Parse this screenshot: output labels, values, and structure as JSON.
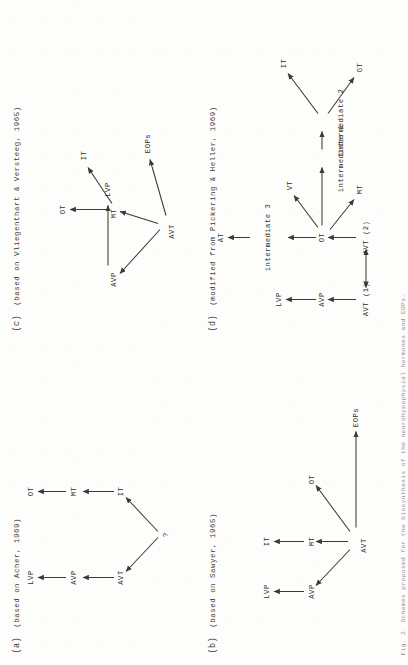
{
  "document": {
    "kind": "scanned-figure",
    "orientation": "rotated-90-ccw",
    "ink_color": "#3a3a38",
    "paper_color": "#fdfdfc"
  },
  "panels": [
    {
      "id": "a",
      "label": "(a)",
      "caption": "(based on Acher, 1969)",
      "nodes": [
        {
          "key": "q",
          "text": "?"
        },
        {
          "key": "avt",
          "text": "AVT"
        },
        {
          "key": "avp",
          "text": "AVP"
        },
        {
          "key": "lvp",
          "text": "LVP"
        },
        {
          "key": "it",
          "text": "IT"
        },
        {
          "key": "mt",
          "text": "MT"
        },
        {
          "key": "ot",
          "text": "OT"
        }
      ],
      "edges": [
        {
          "from": "q",
          "to": "avt",
          "type": "single"
        },
        {
          "from": "q",
          "to": "it",
          "type": "single"
        },
        {
          "from": "avt",
          "to": "avp",
          "type": "single"
        },
        {
          "from": "avp",
          "to": "lvp",
          "type": "single"
        },
        {
          "from": "it",
          "to": "mt",
          "type": "single"
        },
        {
          "from": "mt",
          "to": "ot",
          "type": "single"
        }
      ]
    },
    {
      "id": "b",
      "label": "(b)",
      "caption": "(based on Sawyer, 1965)",
      "nodes": [
        {
          "key": "avt",
          "text": "AVT"
        },
        {
          "key": "avp",
          "text": "AVP"
        },
        {
          "key": "lvp",
          "text": "LVP"
        },
        {
          "key": "mt",
          "text": "MT"
        },
        {
          "key": "it",
          "text": "IT"
        },
        {
          "key": "ot",
          "text": "OT"
        },
        {
          "key": "eops",
          "text": "EOPs"
        }
      ],
      "edges": [
        {
          "from": "avt",
          "to": "avp",
          "type": "single"
        },
        {
          "from": "avp",
          "to": "lvp",
          "type": "single"
        },
        {
          "from": "avt",
          "to": "mt",
          "type": "single"
        },
        {
          "from": "mt",
          "to": "it",
          "type": "single"
        },
        {
          "from": "avt",
          "to": "ot",
          "type": "single"
        },
        {
          "from": "avt",
          "to": "eops",
          "type": "single"
        }
      ]
    },
    {
      "id": "c",
      "label": "(c)",
      "caption": "(based on Vliegenthart & Versteeg, 1965)",
      "nodes": [
        {
          "key": "avt",
          "text": "AVT"
        },
        {
          "key": "avp",
          "text": "AVP"
        },
        {
          "key": "lvp",
          "text": "LVP"
        },
        {
          "key": "mt",
          "text": "MT"
        },
        {
          "key": "ot",
          "text": "OT"
        },
        {
          "key": "it",
          "text": "IT"
        },
        {
          "key": "eops",
          "text": "EOPs"
        }
      ],
      "edges": [
        {
          "from": "avt",
          "to": "avp",
          "type": "single"
        },
        {
          "from": "avp",
          "to": "lvp",
          "type": "single"
        },
        {
          "from": "avt",
          "to": "mt",
          "type": "single"
        },
        {
          "from": "mt",
          "to": "ot",
          "type": "single"
        },
        {
          "from": "mt",
          "to": "it",
          "type": "single"
        },
        {
          "from": "avt",
          "to": "eops",
          "type": "single"
        }
      ]
    },
    {
      "id": "d",
      "label": "(d)",
      "caption": "(modified from Pickering & Heller, 1969)",
      "nodes": [
        {
          "key": "avt1",
          "text": "AVT (1)"
        },
        {
          "key": "avp",
          "text": "AVP"
        },
        {
          "key": "lvp",
          "text": "LVP"
        },
        {
          "key": "avt2",
          "text": "AVT (2)"
        },
        {
          "key": "ot",
          "text": "OT"
        },
        {
          "key": "i3",
          "text": "intermediate 3"
        },
        {
          "key": "at",
          "text": "AT"
        },
        {
          "key": "vt",
          "text": "VT"
        },
        {
          "key": "mt",
          "text": "MT"
        },
        {
          "key": "i1",
          "text": "intermediate 1"
        },
        {
          "key": "i2",
          "text": "intermediate 2"
        },
        {
          "key": "it",
          "text": "IT"
        },
        {
          "key": "gt",
          "text": "GT"
        }
      ],
      "edges": [
        {
          "from": "avt1",
          "to": "avp",
          "type": "single"
        },
        {
          "from": "avp",
          "to": "lvp",
          "type": "single"
        },
        {
          "from": "avt1",
          "to": "avt2",
          "type": "double"
        },
        {
          "from": "avt2",
          "to": "ot",
          "type": "single"
        },
        {
          "from": "ot",
          "to": "i3",
          "type": "single"
        },
        {
          "from": "i3",
          "to": "at",
          "type": "single"
        },
        {
          "from": "ot",
          "to": "vt",
          "type": "single"
        },
        {
          "from": "ot",
          "to": "mt",
          "type": "single"
        },
        {
          "from": "ot",
          "to": "i1",
          "type": "single"
        },
        {
          "from": "i1",
          "to": "i2",
          "type": "single"
        },
        {
          "from": "i2",
          "to": "it",
          "type": "single"
        },
        {
          "from": "i2",
          "to": "gt",
          "type": "single"
        }
      ]
    }
  ],
  "figure_caption": "Fig. 2.  Schemes proposed for the biosynthesis of the neurohypophysial hormones and EOPs."
}
